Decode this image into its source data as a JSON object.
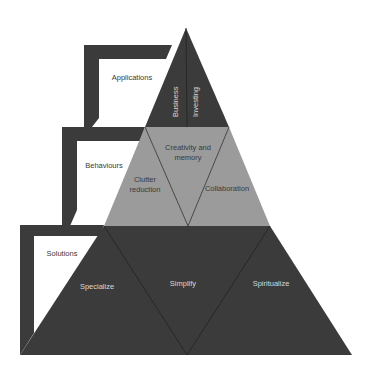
{
  "colors": {
    "dark": "#3b3b3b",
    "mid": "#9b9b9b",
    "background": "#ffffff",
    "light_text": "#d8d8d8",
    "dark_text": "#3a3a3a"
  },
  "brackets": [
    {
      "label": "Applications"
    },
    {
      "label": "Behaviours"
    },
    {
      "label": "Solutions"
    }
  ],
  "pyramid": {
    "top_tier": {
      "segments": [
        "Business",
        "Investing"
      ]
    },
    "middle_tier": {
      "segments": [
        "Clutter reduction",
        "Creativity and memory",
        "Collaboration"
      ],
      "lines": {
        "clutter": [
          "Clutter",
          "reduction"
        ],
        "creativity": [
          "Creativity and",
          "memory"
        ]
      }
    },
    "bottom_tier": {
      "segments": [
        "Specialize",
        "Simplify",
        "Spiritualize"
      ]
    }
  }
}
